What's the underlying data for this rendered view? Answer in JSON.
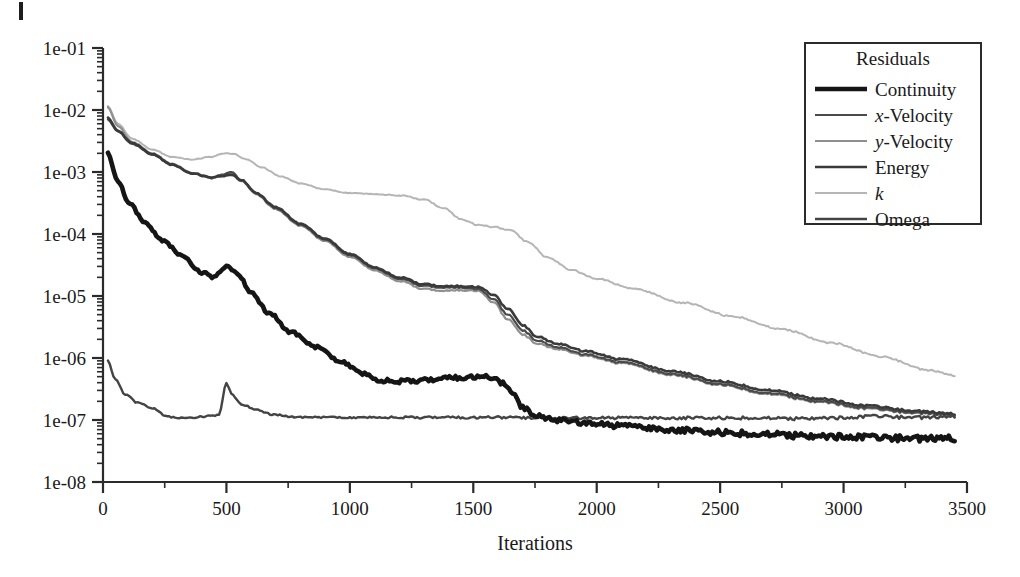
{
  "figure": {
    "background": "#ffffff",
    "axis_color": "#2b2b2b",
    "corner_artifact": true
  },
  "legend": {
    "title": "Residuals",
    "position": "top-right",
    "box": {
      "x": 805,
      "y": 43,
      "width": 176,
      "height": 181
    },
    "entries": [
      {
        "label": "Continuity",
        "label_html": "Continuity",
        "color": "#151515",
        "width": 4.6
      },
      {
        "label": "x-Velocity",
        "label_html": "<i>x</i>-Velocity",
        "color": "#4a4a4a",
        "width": 2.2
      },
      {
        "label": "y-Velocity",
        "label_html": "<i>y</i>-Velocity",
        "color": "#8f8f8f",
        "width": 2.2
      },
      {
        "label": "Energy",
        "label_html": "Energy",
        "color": "#3a3a3a",
        "width": 2.6
      },
      {
        "label": "k",
        "label_html": "<i>k</i>",
        "color": "#b5b5b5",
        "width": 2.0
      },
      {
        "label": "Omega",
        "label_html": "Omega",
        "color": "#444444",
        "width": 2.4
      }
    ]
  },
  "chart_data": {
    "type": "line",
    "title": "",
    "xlabel": "Iterations",
    "ylabel": "",
    "xlim": [
      0,
      3500
    ],
    "ylim": [
      1e-08,
      0.1
    ],
    "yscale": "log",
    "grid": false,
    "xticks": [
      0,
      500,
      1000,
      1500,
      2000,
      2500,
      3000,
      3500
    ],
    "xtick_labels": [
      "0",
      "500",
      "1000",
      "1500",
      "2000",
      "2500",
      "3000",
      "3500"
    ],
    "yticks": [
      0.1,
      0.01,
      0.001,
      0.0001,
      1e-05,
      1e-06,
      1e-07,
      1e-08
    ],
    "ytick_labels": [
      "1e-01",
      "1e-02",
      "1e-03",
      "1e-04",
      "1e-05",
      "1e-06",
      "1e-07",
      "1e-08"
    ],
    "minor_ticks": true,
    "legend_title": "Residuals",
    "series": [
      {
        "name": "Continuity",
        "color": "#151515",
        "width": 4.6,
        "noise": 0.055,
        "x": [
          20,
          60,
          110,
          170,
          240,
          320,
          400,
          450,
          500,
          545,
          600,
          680,
          760,
          860,
          960,
          1060,
          1120,
          1200,
          1320,
          1420,
          1500,
          1560,
          1620,
          1660,
          1700,
          1760,
          1840,
          1950,
          2100,
          2300,
          2500,
          2700,
          2900,
          3100,
          3300,
          3450
        ],
        "y": [
          0.002,
          0.0007,
          0.0003,
          0.00015,
          8e-05,
          4.5e-05,
          2.4e-05,
          2e-05,
          3e-05,
          2.3e-05,
          1.1e-05,
          5e-06,
          2.6e-06,
          1.5e-06,
          9e-07,
          5.5e-07,
          4.3e-07,
          4.2e-07,
          4.4e-07,
          4.8e-07,
          5e-07,
          4.9e-07,
          4e-07,
          2.6e-07,
          1.6e-07,
          1.15e-07,
          1e-07,
          9e-08,
          8e-08,
          7e-08,
          6.3e-08,
          5.8e-08,
          5.4e-08,
          5.2e-08,
          5e-08,
          5e-08
        ]
      },
      {
        "name": "x-Velocity",
        "color": "#4a4a4a",
        "width": 2.2,
        "noise": 0.02,
        "x": [
          20,
          60,
          120,
          200,
          280,
          360,
          440,
          490,
          520,
          560,
          620,
          700,
          800,
          900,
          1000,
          1100,
          1200,
          1300,
          1380,
          1450,
          1520,
          1580,
          1640,
          1700,
          1760,
          1840,
          1950,
          2100,
          2300,
          2500,
          2700,
          2900,
          3100,
          3300,
          3450
        ],
        "y": [
          0.007,
          0.0045,
          0.0028,
          0.0019,
          0.0013,
          0.00095,
          0.0008,
          0.00092,
          0.001,
          0.00075,
          0.00045,
          0.00026,
          0.00014,
          8e-05,
          4.6e-05,
          2.8e-05,
          1.9e-05,
          1.45e-05,
          1.35e-05,
          1.38e-05,
          1.3e-05,
          9e-06,
          5e-06,
          2.8e-06,
          1.9e-06,
          1.5e-06,
          1.15e-06,
          8.5e-07,
          5.6e-07,
          3.8e-07,
          2.7e-07,
          2e-07,
          1.55e-07,
          1.3e-07,
          1.2e-07
        ]
      },
      {
        "name": "y-Velocity",
        "color": "#8f8f8f",
        "width": 2.2,
        "noise": 0.02,
        "x": [
          20,
          60,
          120,
          200,
          280,
          360,
          440,
          490,
          520,
          560,
          620,
          700,
          800,
          900,
          1000,
          1100,
          1200,
          1300,
          1380,
          1450,
          1520,
          1580,
          1640,
          1700,
          1760,
          1840,
          1950,
          2100,
          2300,
          2500,
          2700,
          2900,
          3100,
          3300,
          3450
        ],
        "y": [
          0.011,
          0.0055,
          0.003,
          0.002,
          0.00135,
          0.00098,
          0.00082,
          0.0009,
          0.00095,
          0.00072,
          0.00044,
          0.00025,
          0.000135,
          7.6e-05,
          4.3e-05,
          2.6e-05,
          1.75e-05,
          1.3e-05,
          1.2e-05,
          1.25e-05,
          1.22e-05,
          8e-06,
          4.2e-06,
          2.4e-06,
          1.7e-06,
          1.4e-06,
          1.1e-06,
          8.2e-07,
          5.4e-07,
          3.7e-07,
          2.6e-07,
          1.95e-07,
          1.5e-07,
          1.28e-07,
          1.18e-07
        ]
      },
      {
        "name": "Energy",
        "color": "#3a3a3a",
        "width": 2.6,
        "noise": 0.02,
        "x": [
          20,
          60,
          120,
          200,
          280,
          360,
          440,
          490,
          520,
          560,
          620,
          700,
          800,
          900,
          1000,
          1100,
          1200,
          1300,
          1380,
          1450,
          1520,
          1580,
          1640,
          1700,
          1760,
          1840,
          1950,
          2100,
          2300,
          2500,
          2700,
          2900,
          3100,
          3300,
          3450
        ],
        "y": [
          0.0075,
          0.0046,
          0.0029,
          0.00195,
          0.00132,
          0.00096,
          0.00081,
          0.00086,
          0.0009,
          0.00074,
          0.00046,
          0.00027,
          0.000145,
          8.3e-05,
          4.8e-05,
          2.9e-05,
          2e-05,
          1.55e-05,
          1.42e-05,
          1.45e-05,
          1.4e-05,
          1.05e-05,
          6.2e-06,
          3.4e-06,
          2.2e-06,
          1.7e-06,
          1.3e-06,
          9.5e-07,
          6.2e-07,
          4.2e-07,
          3e-07,
          2.2e-07,
          1.68e-07,
          1.38e-07,
          1.25e-07
        ]
      },
      {
        "name": "k",
        "color": "#b5b5b5",
        "width": 2.0,
        "noise": 0.015,
        "x": [
          20,
          60,
          120,
          200,
          280,
          360,
          440,
          490,
          530,
          580,
          640,
          720,
          800,
          900,
          1000,
          1100,
          1200,
          1300,
          1380,
          1450,
          1520,
          1580,
          1650,
          1720,
          1800,
          1900,
          2000,
          2150,
          2350,
          2550,
          2750,
          2950,
          3150,
          3350,
          3450
        ],
        "y": [
          0.0115,
          0.006,
          0.0034,
          0.0023,
          0.00175,
          0.0016,
          0.00175,
          0.002,
          0.00195,
          0.0016,
          0.0012,
          0.00085,
          0.00065,
          0.00052,
          0.00046,
          0.00044,
          0.00042,
          0.00036,
          0.00026,
          0.000175,
          0.00014,
          0.00013,
          0.000115,
          7.5e-05,
          4.2e-05,
          2.6e-05,
          1.9e-05,
          1.3e-05,
          7.8e-06,
          4.7e-06,
          2.9e-06,
          1.75e-06,
          1.05e-06,
          6.3e-07,
          5.2e-07
        ]
      },
      {
        "name": "Omega",
        "color": "#444444",
        "width": 2.4,
        "noise": 0.03,
        "x": [
          20,
          50,
          90,
          140,
          200,
          260,
          300,
          360,
          420,
          470,
          500,
          520,
          560,
          620,
          700,
          800,
          900,
          1000,
          1200,
          1400,
          1600,
          1800,
          2000,
          2200,
          2400,
          2600,
          2800,
          3000,
          3150,
          3250,
          3350,
          3450
        ],
        "y": [
          9e-07,
          4.5e-07,
          2.6e-07,
          1.9e-07,
          1.55e-07,
          1.15e-07,
          1.08e-07,
          1.1e-07,
          1.15e-07,
          1.2e-07,
          4e-07,
          2.6e-07,
          1.8e-07,
          1.45e-07,
          1.2e-07,
          1.1e-07,
          1.1e-07,
          1.1e-07,
          1.1e-07,
          1.1e-07,
          1.1e-07,
          1.08e-07,
          1.08e-07,
          1.08e-07,
          1.08e-07,
          1.08e-07,
          1.05e-07,
          1.08e-07,
          1.15e-07,
          1.1e-07,
          1.1e-07,
          1.12e-07
        ]
      }
    ]
  }
}
